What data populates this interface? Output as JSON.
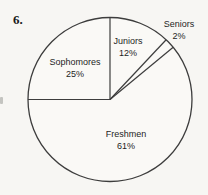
{
  "figure": {
    "number": "6."
  },
  "chart_data": {
    "type": "pie",
    "title": "",
    "categories": [
      "Juniors",
      "Seniors",
      "Freshmen",
      "Sophomores"
    ],
    "values": [
      12,
      2,
      61,
      25
    ],
    "percent_labels": [
      "12%",
      "2%",
      "61%",
      "25%"
    ],
    "start_angle": "12-oclock",
    "direction": "clockwise",
    "legend": "none",
    "label_placement": {
      "Juniors": "inside",
      "Seniors": "outside",
      "Freshmen": "inside",
      "Sophomores": "inside"
    },
    "colors": {
      "background": "#f7f6f3",
      "line": "#3d3d3d",
      "pie_fill": "#faf9f6",
      "text": "#1e1e1e"
    }
  }
}
